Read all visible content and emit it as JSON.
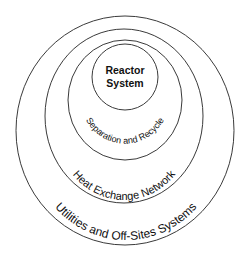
{
  "diagram": {
    "type": "concentric-onion",
    "layers": [
      {
        "id": "reactor",
        "label_line1": "Reactor",
        "label_line2": "System"
      },
      {
        "id": "separation",
        "label": "Separation and Recycle"
      },
      {
        "id": "heat",
        "label": "Heat Exchange Network"
      },
      {
        "id": "utilities",
        "label": "Utilities and Off-Sites Systems"
      }
    ],
    "colors": {
      "stroke": "#3a3a3a",
      "text": "#111111",
      "background": "#ffffff"
    }
  }
}
